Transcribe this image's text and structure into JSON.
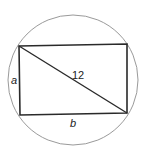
{
  "diagram": {
    "labels": {
      "diagonal": "12",
      "side_a": "a",
      "side_b": "b"
    },
    "colors": {
      "circle": "#9a9a9a",
      "rectangle": "#2a2a2a",
      "text": "#222222"
    }
  }
}
